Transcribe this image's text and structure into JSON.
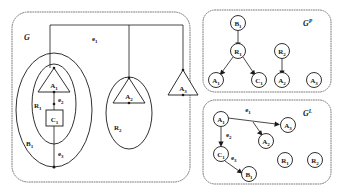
{
  "figure": {
    "panels": [
      {
        "id": "G",
        "label_base": "G",
        "label_sup": ""
      },
      {
        "id": "GP",
        "label_base": "G",
        "label_sup": "P"
      },
      {
        "id": "GL",
        "label_base": "G",
        "label_sup": "L"
      }
    ]
  },
  "graph_g": {
    "title_base": "G",
    "title_sup": "",
    "containers": [
      {
        "name": "B1",
        "base": "B",
        "sub": "1",
        "shape": "ellipse",
        "contains": [
          "R1"
        ]
      },
      {
        "name": "R1",
        "base": "R",
        "sub": "1",
        "shape": "ellipse",
        "contains": [
          "A1",
          "C1"
        ]
      },
      {
        "name": "R2",
        "base": "R",
        "sub": "2",
        "shape": "ellipse",
        "contains": [
          "A2"
        ]
      }
    ],
    "nodes": [
      {
        "name": "A1",
        "base": "A",
        "sub": "1",
        "shape": "triangle"
      },
      {
        "name": "A2",
        "base": "A",
        "sub": "2",
        "shape": "triangle"
      },
      {
        "name": "A3",
        "base": "A",
        "sub": "3",
        "shape": "triangle"
      },
      {
        "name": "C1",
        "base": "C",
        "sub": "1",
        "shape": "square"
      }
    ],
    "edges": [
      {
        "name": "e1",
        "base": "e",
        "sub": "1",
        "kind": "hyperedge",
        "endpoints": [
          "A1",
          "A2",
          "A3"
        ]
      },
      {
        "name": "e2",
        "base": "e",
        "sub": "2",
        "kind": "edge",
        "endpoints": [
          "A1",
          "C1"
        ]
      },
      {
        "name": "e3",
        "base": "e",
        "sub": "3",
        "kind": "edge",
        "endpoints": [
          "C1",
          "B1"
        ]
      }
    ]
  },
  "graph_gp": {
    "title_base": "G",
    "title_sup": "P",
    "nodes": [
      {
        "name": "B1",
        "base": "B",
        "sub": "1"
      },
      {
        "name": "R1",
        "base": "R",
        "sub": "1"
      },
      {
        "name": "R2",
        "base": "R",
        "sub": "2"
      },
      {
        "name": "A1",
        "base": "A",
        "sub": "1"
      },
      {
        "name": "C1",
        "base": "C",
        "sub": "1"
      },
      {
        "name": "A2",
        "base": "A",
        "sub": "2"
      },
      {
        "name": "A3",
        "base": "A",
        "sub": "3"
      }
    ],
    "arcs": [
      {
        "from": "B1",
        "to": "R1"
      },
      {
        "from": "R1",
        "to": "A1"
      },
      {
        "from": "R1",
        "to": "C1"
      },
      {
        "from": "R2",
        "to": "A2"
      }
    ]
  },
  "graph_gl": {
    "title_base": "G",
    "title_sup": "L",
    "nodes": [
      {
        "name": "A1",
        "base": "A",
        "sub": "1"
      },
      {
        "name": "A3",
        "base": "A",
        "sub": "3"
      },
      {
        "name": "A2",
        "base": "A",
        "sub": "2"
      },
      {
        "name": "C1",
        "base": "C",
        "sub": "1"
      },
      {
        "name": "B1",
        "base": "B",
        "sub": "1"
      },
      {
        "name": "R1",
        "base": "R",
        "sub": "1"
      },
      {
        "name": "R2",
        "base": "R",
        "sub": "2"
      }
    ],
    "arcs": [
      {
        "from": "A1",
        "to": "A3",
        "label_base": "e",
        "label_sub": "1"
      },
      {
        "from": "A1",
        "to": "A2",
        "label_base": "",
        "label_sub": ""
      },
      {
        "from": "A1",
        "to": "C1",
        "label_base": "e",
        "label_sub": "2"
      },
      {
        "from": "C1",
        "to": "B1",
        "label_base": "e",
        "label_sub": "3"
      }
    ]
  },
  "colors": {
    "ink": "#1a1a1a",
    "panel_border": "#6b6b6b",
    "background": "#ffffff"
  }
}
